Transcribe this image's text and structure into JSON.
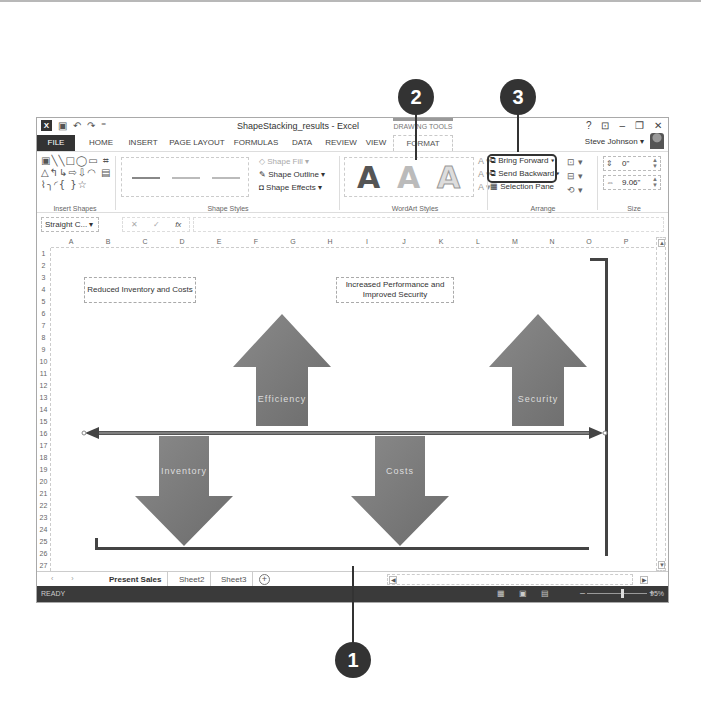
{
  "callouts": [
    {
      "number": "1"
    },
    {
      "number": "2"
    },
    {
      "number": "3"
    }
  ],
  "titlebar": {
    "document_title": "ShapeStacking_results - Excel",
    "contextual_tab_group": "DRAWING TOOLS",
    "help": "?",
    "ribbon_display": "⊡",
    "minimize": "–",
    "restore": "❐",
    "close": "✕",
    "quick_access": {
      "app_icon": "X",
      "save": "💾",
      "undo": "↶",
      "redo": "↷",
      "customize": "⁼"
    }
  },
  "tabs": [
    {
      "label": "FILE"
    },
    {
      "label": "HOME"
    },
    {
      "label": "INSERT"
    },
    {
      "label": "PAGE LAYOUT"
    },
    {
      "label": "FORMULAS"
    },
    {
      "label": "DATA"
    },
    {
      "label": "REVIEW"
    },
    {
      "label": "VIEW"
    },
    {
      "label": "FORMAT"
    }
  ],
  "user": {
    "name": "Steve Johnson ▾"
  },
  "ribbon": {
    "insert_shapes": {
      "label": "Insert Shapes",
      "row1": "▣╲╲□◯▭ ⌗",
      "row2": "△↰↳⇨⇩◠ ▤",
      "row3": "⌇╮◜{ }☆"
    },
    "shape_styles": {
      "label": "Shape Styles",
      "fill": "Shape Fill ▾",
      "outline": "Shape Outline ▾",
      "effects": "Shape Effects ▾"
    },
    "wordart_styles": {
      "label": "WordArt Styles",
      "sample": "A",
      "side": [
        "A ▾",
        "A ▾",
        "A ▾"
      ]
    },
    "arrange": {
      "label": "Arrange",
      "bring_forward": "Bring Forward ▾",
      "send_backward": "Send Backward ▾",
      "selection_pane": "Selection Pane",
      "right": [
        "⊡ ▾",
        "⊟ ▾",
        "⟲ ▾"
      ]
    },
    "size": {
      "label": "Size",
      "height_value": "0\"",
      "width_value": "9.06\""
    }
  },
  "formula_bar": {
    "name_box": "Straight C... ▾",
    "cancel": "✕",
    "enter": "✓",
    "fx": "fx",
    "value": ""
  },
  "columns": [
    "A",
    "B",
    "C",
    "D",
    "E",
    "F",
    "G",
    "H",
    "I",
    "J",
    "K",
    "L",
    "M",
    "N",
    "O",
    "P"
  ],
  "rows": [
    "1",
    "2",
    "3",
    "4",
    "5",
    "6",
    "7",
    "8",
    "9",
    "10",
    "11",
    "12",
    "13",
    "14",
    "15",
    "16",
    "17",
    "18",
    "19",
    "20",
    "21",
    "22",
    "23",
    "24",
    "25",
    "26",
    "27"
  ],
  "shapes": {
    "textbox_left": "Reduced Inventory and Costs",
    "textbox_right": "Increased Performance and Improved Security",
    "arrow_efficiency": "Efficiency",
    "arrow_security": "Security",
    "arrow_inventory": "Inventory",
    "arrow_costs": "Costs"
  },
  "sheets": [
    {
      "label": "Present Sales",
      "active": true
    },
    {
      "label": "Sheet2",
      "active": false
    },
    {
      "label": "Sheet3",
      "active": false
    }
  ],
  "sheet_nav": "‹ ›",
  "add_sheet": "+",
  "status": {
    "text": "READY",
    "zoom_minus": "–",
    "zoom_plus": "+",
    "zoom": "95%"
  },
  "colors": {
    "arrow_fill": "#767676",
    "statusbar": "#3a3a3a",
    "callout": "#333333"
  }
}
